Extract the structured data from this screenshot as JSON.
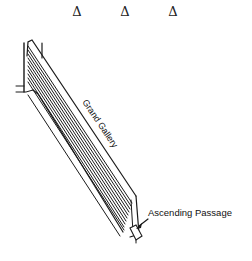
{
  "diagram": {
    "markers": [
      {
        "symbol": "Δ",
        "x": 77
      },
      {
        "symbol": "Δ",
        "x": 125
      },
      {
        "symbol": "Δ",
        "x": 173
      }
    ],
    "labels": {
      "gallery": "Grand Gallery",
      "passage": "Ascending Passage"
    },
    "colors": {
      "background": "#ffffff",
      "line": "#1a1a1a"
    }
  }
}
